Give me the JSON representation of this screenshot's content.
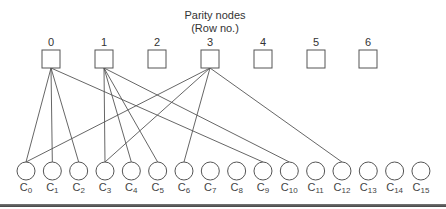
{
  "title": {
    "line1": "Parity nodes",
    "line2": "(Row no.)"
  },
  "parity_nodes": [
    {
      "label": "0",
      "x": 51
    },
    {
      "label": "1",
      "x": 104
    },
    {
      "label": "2",
      "x": 157
    },
    {
      "label": "3",
      "x": 210
    },
    {
      "label": "4",
      "x": 263
    },
    {
      "label": "5",
      "x": 316
    },
    {
      "label": "6",
      "x": 368
    }
  ],
  "code_nodes": [
    {
      "base": "C",
      "sub": "0"
    },
    {
      "base": "C",
      "sub": "1"
    },
    {
      "base": "C",
      "sub": "2"
    },
    {
      "base": "C",
      "sub": "3"
    },
    {
      "base": "C",
      "sub": "4"
    },
    {
      "base": "C",
      "sub": "5"
    },
    {
      "base": "C",
      "sub": "6"
    },
    {
      "base": "C",
      "sub": "7"
    },
    {
      "base": "C",
      "sub": "8"
    },
    {
      "base": "C",
      "sub": "9"
    },
    {
      "base": "C",
      "sub": "10"
    },
    {
      "base": "C",
      "sub": "11"
    },
    {
      "base": "C",
      "sub": "12"
    },
    {
      "base": "C",
      "sub": "13"
    },
    {
      "base": "C",
      "sub": "14"
    },
    {
      "base": "C",
      "sub": "15"
    }
  ],
  "edges": [
    {
      "parity": 0,
      "code": 0
    },
    {
      "parity": 0,
      "code": 1
    },
    {
      "parity": 0,
      "code": 2
    },
    {
      "parity": 0,
      "code": 9
    },
    {
      "parity": 1,
      "code": 3
    },
    {
      "parity": 1,
      "code": 4
    },
    {
      "parity": 1,
      "code": 5
    },
    {
      "parity": 1,
      "code": 10
    },
    {
      "parity": 3,
      "code": 0
    },
    {
      "parity": 3,
      "code": 3
    },
    {
      "parity": 3,
      "code": 6
    },
    {
      "parity": 3,
      "code": 12
    }
  ],
  "colors": {
    "stroke": "#555555",
    "text": "#333333",
    "rule": "#555555"
  }
}
